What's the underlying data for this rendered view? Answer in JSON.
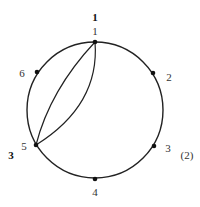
{
  "diagram": {
    "circle": {
      "cx": 95,
      "cy": 110,
      "r": 68,
      "stroke": "#222222"
    },
    "vertices": [
      {
        "label": "1",
        "x": 95,
        "y": 42,
        "lx": 95,
        "ly": 35,
        "anchor": "middle"
      },
      {
        "label": "2",
        "x": 153,
        "y": 73,
        "lx": 167,
        "ly": 80,
        "anchor": "middle"
      },
      {
        "label": "3",
        "x": 154,
        "y": 146,
        "lx": 167,
        "ly": 151,
        "anchor": "middle"
      },
      {
        "label": "4",
        "x": 95,
        "y": 179,
        "lx": 95,
        "ly": 196,
        "anchor": "middle"
      },
      {
        "label": "5",
        "x": 36,
        "y": 145,
        "lx": 22,
        "ly": 150,
        "anchor": "middle"
      },
      {
        "label": "6",
        "x": 37,
        "y": 72,
        "lx": 22,
        "ly": 76,
        "anchor": "middle"
      }
    ],
    "chords": [
      {
        "from": "1",
        "to": "5",
        "bulge": "left"
      },
      {
        "from": "1",
        "to": "5",
        "bulge": "right"
      }
    ],
    "bold_labels": [
      {
        "text": "1",
        "x": 95,
        "y": 20
      },
      {
        "text": "3",
        "x": 10,
        "y": 158
      }
    ],
    "caption": "(2)"
  }
}
